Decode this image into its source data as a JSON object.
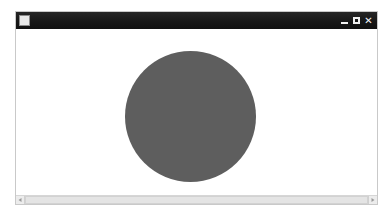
{
  "window": {
    "title": "",
    "icon": "application-icon",
    "controls": {
      "minimize_label": "",
      "maximize_label": "",
      "close_label": "✕"
    }
  },
  "canvas": {
    "background_color": "#ffffff",
    "shapes": [
      {
        "kind": "circle",
        "name": "gray-circle",
        "fill_color": "#5e5e5e",
        "center_x": 190,
        "center_y": 116,
        "diameter": 131
      }
    ]
  },
  "scrollbar": {
    "orientation": "horizontal",
    "left_arrow": "",
    "right_arrow": "",
    "thumb_fraction": 1.0
  },
  "colors": {
    "titlebar": "#1c1c1c",
    "window_border": "#c9c9c9",
    "page_background": "#ffffff",
    "shape_gray": "#5e5e5e"
  }
}
